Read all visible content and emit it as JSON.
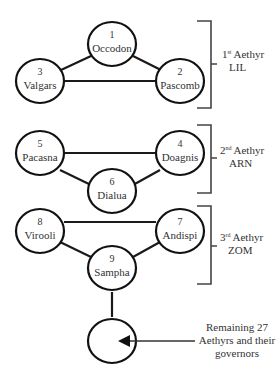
{
  "groups": [
    {
      "ordinal": "1",
      "ordinal_suffix": "st",
      "label_word": "Aethyr",
      "name": "LIL",
      "governors": [
        {
          "number": "1",
          "name": "Occodon"
        },
        {
          "number": "2",
          "name": "Pascomb"
        },
        {
          "number": "3",
          "name": "Valgars"
        }
      ]
    },
    {
      "ordinal": "2",
      "ordinal_suffix": "nd",
      "label_word": "Aethyr",
      "name": "ARN",
      "governors": [
        {
          "number": "4",
          "name": "Doagnis"
        },
        {
          "number": "5",
          "name": "Pacasna"
        },
        {
          "number": "6",
          "name": "Dialua"
        }
      ]
    },
    {
      "ordinal": "3",
      "ordinal_suffix": "rd",
      "label_word": "Aethyr",
      "name": "ZOM",
      "governors": [
        {
          "number": "7",
          "name": "Andispi"
        },
        {
          "number": "8",
          "name": "Virooli"
        },
        {
          "number": "9",
          "name": "Sampha"
        }
      ]
    }
  ],
  "remaining": {
    "line1": "Remaining 27",
    "line2": "Aethyrs and their",
    "line3": "governors"
  }
}
